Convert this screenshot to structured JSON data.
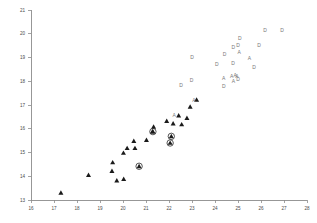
{
  "chart_data": {
    "type": "scatter",
    "title": "",
    "subtitle": "",
    "xlabel": "",
    "ylabel": "",
    "xlim": [
      16,
      28
    ],
    "ylim": [
      13,
      21
    ],
    "grid": false,
    "legend": null,
    "x_ticks": [
      16,
      17,
      18,
      19,
      20,
      21,
      22,
      23,
      24,
      25,
      26,
      27,
      28
    ],
    "y_ticks": [
      13,
      14,
      15,
      16,
      17,
      18,
      19,
      20,
      21
    ],
    "x_tick_labels": [
      "16",
      "17",
      "18",
      "19",
      "20",
      "21",
      "22",
      "23",
      "24",
      "25",
      "26",
      "27",
      "28"
    ],
    "y_tick_labels": [
      "13",
      "14",
      "15",
      "16",
      "17",
      "18",
      "19",
      "20",
      "21"
    ],
    "series": [
      {
        "name": "triangle",
        "marker": "filled-triangle",
        "color": "#1a1a1a",
        "points": [
          [
            17.3,
            13.3
          ],
          [
            18.5,
            14.05
          ],
          [
            19.52,
            14.22
          ],
          [
            19.55,
            14.58
          ],
          [
            19.73,
            13.82
          ],
          [
            20.03,
            13.88
          ],
          [
            20.02,
            14.98
          ],
          [
            20.18,
            15.18
          ],
          [
            20.47,
            15.48
          ],
          [
            20.52,
            15.18
          ],
          [
            21.02,
            15.52
          ],
          [
            21.28,
            15.88
          ],
          [
            21.33,
            16.08
          ],
          [
            21.9,
            16.32
          ],
          [
            22.18,
            16.22
          ],
          [
            22.55,
            16.18
          ],
          [
            22.78,
            16.45
          ],
          [
            22.42,
            16.55
          ],
          [
            22.92,
            16.92
          ],
          [
            23.2,
            17.22
          ]
        ]
      },
      {
        "name": "triangle-circled",
        "marker": "filled-triangle-ringed",
        "color": "#1a1a1a",
        "points": [
          [
            20.7,
            14.42
          ],
          [
            21.3,
            15.88
          ],
          [
            22.05,
            15.4
          ],
          [
            22.1,
            15.68
          ]
        ]
      },
      {
        "name": "A",
        "marker": "letter-A",
        "color": "#777777",
        "points": [
          [
            22.22,
            16.55
          ],
          [
            23.08,
            17.2
          ],
          [
            24.38,
            18.1
          ],
          [
            24.72,
            18.18
          ],
          [
            24.88,
            18.22
          ],
          [
            24.95,
            18.2
          ],
          [
            24.8,
            18.0
          ],
          [
            25.05,
            19.22
          ],
          [
            25.5,
            18.95
          ]
        ]
      },
      {
        "name": "D",
        "marker": "letter-D",
        "color": "#777777",
        "points": [
          [
            22.52,
            17.8
          ],
          [
            22.98,
            18.02
          ],
          [
            23.0,
            19.0
          ],
          [
            24.08,
            18.7
          ],
          [
            24.38,
            17.78
          ],
          [
            24.42,
            19.12
          ],
          [
            24.78,
            18.72
          ],
          [
            24.8,
            19.42
          ],
          [
            25.0,
            18.08
          ],
          [
            25.0,
            19.5
          ],
          [
            25.08,
            19.8
          ],
          [
            25.7,
            18.58
          ],
          [
            25.92,
            19.48
          ],
          [
            26.18,
            20.12
          ],
          [
            26.92,
            20.15
          ]
        ]
      }
    ]
  }
}
